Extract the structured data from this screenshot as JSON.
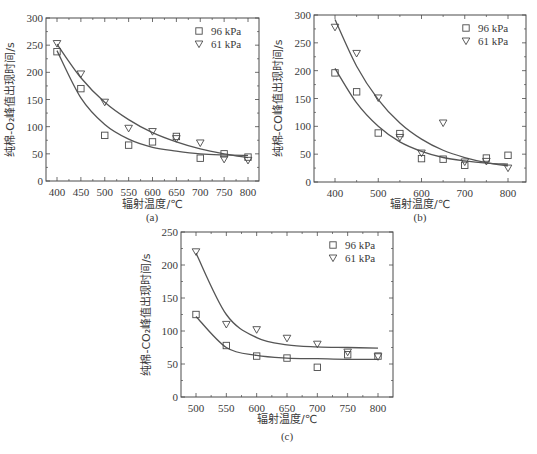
{
  "chart_data": [
    {
      "id": "a",
      "type": "scatter",
      "caption": "(a)",
      "xlabel": "辐射温度/℃",
      "ylabel": "纯棉-O₂峰值出现时间/s",
      "xlim": [
        375,
        825
      ],
      "ylim": [
        0,
        300
      ],
      "xticks": [
        400,
        450,
        500,
        550,
        600,
        650,
        700,
        750,
        800
      ],
      "yticks": [
        0,
        50,
        100,
        150,
        200,
        250,
        300
      ],
      "legend_position": "upper right",
      "grid": false,
      "x": [
        400,
        450,
        500,
        550,
        600,
        650,
        700,
        750,
        800
      ],
      "series": [
        {
          "name": "96 kPa",
          "marker": "square",
          "values": [
            238,
            170,
            84,
            66,
            72,
            82,
            42,
            50,
            44
          ],
          "fit": [
            240,
            153,
            104,
            77,
            62,
            55,
            50,
            48,
            47
          ]
        },
        {
          "name": "61 kPa",
          "marker": "triangle-down",
          "values": [
            253,
            197,
            145,
            97,
            91,
            78,
            70,
            40,
            38
          ],
          "fit": [
            252,
            190,
            145,
            113,
            89,
            72,
            59,
            50,
            43
          ]
        }
      ]
    },
    {
      "id": "b",
      "type": "scatter",
      "caption": "(b)",
      "xlabel": "辐射温度/℃",
      "ylabel": "纯棉-CO峰值出现时间/s",
      "xlim": [
        350,
        850
      ],
      "ylim": [
        0,
        300
      ],
      "xticks": [
        400,
        500,
        600,
        700,
        800
      ],
      "yticks": [
        0,
        50,
        100,
        150,
        200,
        250,
        300
      ],
      "legend_position": "upper right",
      "grid": false,
      "x": [
        400,
        450,
        500,
        550,
        600,
        650,
        700,
        750,
        800
      ],
      "series": [
        {
          "name": "96 kPa",
          "marker": "square",
          "values": [
            196,
            162,
            88,
            87,
            42,
            41,
            30,
            43,
            48
          ],
          "fit": [
            204,
            142,
            100,
            72,
            55,
            44,
            38,
            34,
            32
          ]
        },
        {
          "name": "61 kPa",
          "marker": "triangle-down",
          "values": [
            278,
            231,
            151,
            80,
            52,
            106,
            36,
            37,
            25
          ],
          "fit": [
            292,
            208,
            148,
            106,
            77,
            57,
            44,
            35,
            29
          ]
        }
      ]
    },
    {
      "id": "c",
      "type": "scatter",
      "caption": "(c)",
      "xlabel": "辐射温度/℃",
      "ylabel": "纯棉-CO₂峰值出现时间/s",
      "xlim": [
        475,
        825
      ],
      "ylim": [
        0,
        250
      ],
      "xticks": [
        500,
        550,
        600,
        650,
        700,
        750,
        800
      ],
      "yticks": [
        0,
        50,
        100,
        150,
        200,
        250
      ],
      "legend_position": "upper right",
      "grid": false,
      "x": [
        500,
        550,
        600,
        650,
        700,
        750,
        800
      ],
      "series": [
        {
          "name": "96 kPa",
          "marker": "square",
          "values": [
            125,
            78,
            62,
            59,
            45,
            64,
            62
          ],
          "fit": [
            122,
            75,
            63,
            59,
            58,
            57,
            57
          ]
        },
        {
          "name": "61 kPa",
          "marker": "triangle-down",
          "values": [
            220,
            110,
            102,
            89,
            80,
            68,
            61
          ],
          "fit": [
            218,
            125,
            90,
            79,
            76,
            75,
            74
          ]
        }
      ]
    }
  ]
}
